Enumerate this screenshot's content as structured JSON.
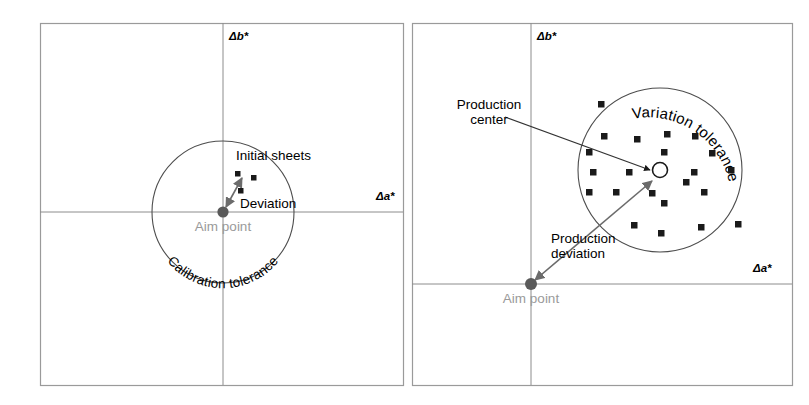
{
  "figure": {
    "type": "diagram",
    "background_color": "#ffffff",
    "axis_color": "#808080",
    "frame_color": "#9a9a9a",
    "circle_color": "#4d4d4d",
    "marker_color": "#1a1a1a",
    "aim_point_color": "#595959",
    "aim_label_color": "#9a9a9a",
    "label_color": "#000000",
    "arrow_color": "#666666"
  },
  "panels": [
    {
      "id": "left",
      "name": "calibration-panel",
      "axis_labels": {
        "x": "Δa*",
        "y": "Δb*"
      },
      "tolerance_circle_label": "Calibration tolerance",
      "aim_point_label": "Aim point",
      "annotations": [
        {
          "name": "initial-sheets",
          "text": "Initial sheets"
        },
        {
          "name": "deviation",
          "text": "Deviation"
        }
      ],
      "geometry": {
        "frame": {
          "x": 40,
          "y": 23,
          "w": 363,
          "h": 362
        },
        "origin": {
          "x": 223,
          "y": 212
        },
        "circle": {
          "cx": 223,
          "cy": 212,
          "r": 71
        }
      },
      "sample_points": [
        {
          "x": 238,
          "y": 174
        },
        {
          "x": 254,
          "y": 178
        },
        {
          "x": 241,
          "y": 191
        }
      ]
    },
    {
      "id": "right",
      "name": "production-panel",
      "axis_labels": {
        "x": "Δa*",
        "y": "Δb*"
      },
      "tolerance_circle_label": "Variation tolerance",
      "aim_point_label": "Aim point",
      "annotations": [
        {
          "name": "production-center",
          "text": "Production\ncenter",
          "line1": "Production",
          "line2": "center"
        },
        {
          "name": "production-deviation",
          "text": "Production\ndeviation",
          "line1": "Production",
          "line2": "deviation"
        }
      ],
      "geometry": {
        "frame": {
          "x": 412,
          "y": 23,
          "w": 380,
          "h": 362
        },
        "origin": {
          "x": 531,
          "y": 284
        },
        "circle": {
          "cx": 660,
          "cy": 170,
          "r": 82
        },
        "production_center": {
          "x": 660,
          "y": 170,
          "r": 8
        }
      },
      "sample_points": [
        {
          "x": 601,
          "y": 104
        },
        {
          "x": 604,
          "y": 136
        },
        {
          "x": 637,
          "y": 139
        },
        {
          "x": 667,
          "y": 134
        },
        {
          "x": 695,
          "y": 136
        },
        {
          "x": 589,
          "y": 152
        },
        {
          "x": 664,
          "y": 152
        },
        {
          "x": 712,
          "y": 153
        },
        {
          "x": 593,
          "y": 172
        },
        {
          "x": 629,
          "y": 172
        },
        {
          "x": 694,
          "y": 172
        },
        {
          "x": 731,
          "y": 170
        },
        {
          "x": 589,
          "y": 192
        },
        {
          "x": 616,
          "y": 192
        },
        {
          "x": 652,
          "y": 193
        },
        {
          "x": 686,
          "y": 182
        },
        {
          "x": 704,
          "y": 192
        },
        {
          "x": 664,
          "y": 203
        },
        {
          "x": 634,
          "y": 225
        },
        {
          "x": 701,
          "y": 227
        },
        {
          "x": 661,
          "y": 233
        },
        {
          "x": 738,
          "y": 224
        }
      ]
    }
  ]
}
